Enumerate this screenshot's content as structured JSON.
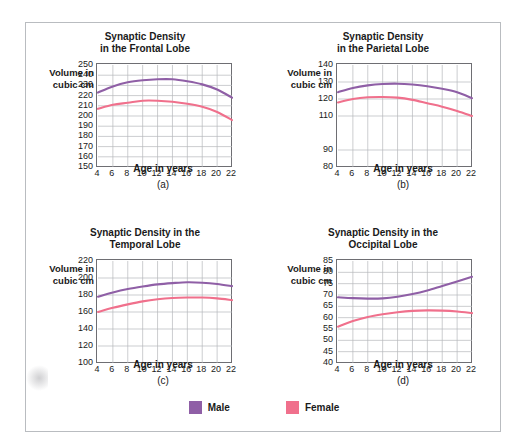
{
  "figure": {
    "legend": {
      "items": [
        {
          "label": "Male",
          "color": "#8f5fa6"
        },
        {
          "label": "Female",
          "color": "#f0708c"
        }
      ]
    }
  },
  "chart_data": [
    {
      "id": "a",
      "type": "line",
      "title_line1": "Synaptic Density",
      "title_line2": "in the Frontal Lobe",
      "caption": "(a)",
      "xlabel": "Age in years",
      "ylabel_line1": "Volume in",
      "ylabel_line2": "cubic cm",
      "x": [
        4,
        6,
        8,
        10,
        12,
        14,
        16,
        18,
        20,
        22
      ],
      "xticks": [
        4,
        6,
        8,
        10,
        12,
        14,
        16,
        18,
        20,
        22
      ],
      "yticks": [
        250,
        240,
        230,
        220,
        210,
        200,
        190,
        180,
        170,
        160,
        150
      ],
      "ylim": [
        150,
        250
      ],
      "xlim": [
        4,
        22
      ],
      "grid": true,
      "series": [
        {
          "name": "Male",
          "color": "#8f5fa6",
          "values": [
            223,
            229,
            233,
            235,
            236,
            236,
            234,
            231,
            226,
            218
          ]
        },
        {
          "name": "Female",
          "color": "#f0708c",
          "values": [
            207,
            211,
            213,
            215,
            215,
            214,
            212,
            209,
            204,
            196
          ]
        }
      ]
    },
    {
      "id": "b",
      "type": "line",
      "title_line1": "Synaptic Density",
      "title_line2": "in the Parietal Lobe",
      "caption": "(b)",
      "xlabel": "Age in years",
      "ylabel_line1": "Volume in",
      "ylabel_line2": "cubic cm",
      "x": [
        4,
        6,
        8,
        10,
        12,
        14,
        16,
        18,
        20,
        22
      ],
      "xticks": [
        4,
        6,
        8,
        10,
        12,
        14,
        16,
        18,
        20,
        22
      ],
      "yticks": [
        140,
        130,
        120,
        110,
        90,
        80
      ],
      "ylim": [
        80,
        140
      ],
      "xlim": [
        4,
        22
      ],
      "grid": true,
      "series": [
        {
          "name": "Male",
          "color": "#8f5fa6",
          "values": [
            124,
            126.5,
            128,
            128.8,
            129,
            128.5,
            127.5,
            126,
            124,
            120.5
          ]
        },
        {
          "name": "Female",
          "color": "#f0708c",
          "values": [
            118,
            120,
            121,
            121.2,
            120.8,
            119.5,
            117.5,
            115.5,
            113,
            110
          ]
        }
      ]
    },
    {
      "id": "c",
      "type": "line",
      "title_line1": "Synaptic Density in the",
      "title_line2": "Temporal Lobe",
      "caption": "(c)",
      "xlabel": "Age in years",
      "ylabel_line1": "Volume in",
      "ylabel_line2": "cubic cm",
      "x": [
        4,
        6,
        8,
        10,
        12,
        14,
        16,
        18,
        20,
        22
      ],
      "xticks": [
        4,
        6,
        8,
        10,
        12,
        14,
        16,
        18,
        20,
        22
      ],
      "yticks": [
        220,
        200,
        180,
        160,
        140,
        120,
        100
      ],
      "ylim": [
        100,
        220
      ],
      "xlim": [
        4,
        22
      ],
      "grid": true,
      "series": [
        {
          "name": "Male",
          "color": "#8f5fa6",
          "values": [
            178,
            183,
            187,
            190,
            192.5,
            194,
            195,
            194.5,
            193,
            190.5
          ]
        },
        {
          "name": "Female",
          "color": "#f0708c",
          "values": [
            160,
            165,
            169,
            172.5,
            175,
            176.5,
            177,
            177,
            176,
            174
          ]
        }
      ]
    },
    {
      "id": "d",
      "type": "line",
      "title_line1": "Synaptic Density in the",
      "title_line2": "Occipital Lobe",
      "caption": "(d)",
      "xlabel": "Age in years",
      "ylabel_line1": "Volume in",
      "ylabel_line2": "cubic cm",
      "x": [
        4,
        6,
        8,
        10,
        12,
        14,
        16,
        18,
        20,
        22
      ],
      "xticks": [
        4,
        6,
        8,
        10,
        12,
        14,
        16,
        18,
        20,
        22
      ],
      "yticks": [
        85,
        80,
        75,
        70,
        65,
        60,
        55,
        50,
        45,
        40
      ],
      "ylim": [
        40,
        85
      ],
      "xlim": [
        4,
        22
      ],
      "grid": true,
      "series": [
        {
          "name": "Male",
          "color": "#8f5fa6",
          "values": [
            69,
            68.6,
            68.4,
            68.5,
            69.2,
            70.4,
            72,
            74,
            76,
            78
          ]
        },
        {
          "name": "Female",
          "color": "#f0708c",
          "values": [
            56,
            58.5,
            60.3,
            61.5,
            62.4,
            63,
            63.2,
            63.1,
            62.7,
            62
          ]
        }
      ]
    }
  ]
}
